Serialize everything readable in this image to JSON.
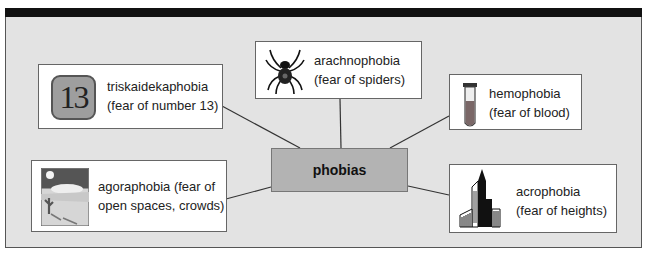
{
  "diagram": {
    "center": {
      "label": "phobias"
    },
    "nodes": [
      {
        "id": "triskaidekaphobia",
        "line1": "triskaidekaphobia",
        "line2": "(fear of number 13)",
        "icon": "number-13-icon",
        "icon_text": "13"
      },
      {
        "id": "arachnophobia",
        "line1": "arachnophobia",
        "line2": "(fear of spiders)",
        "icon": "spider-icon"
      },
      {
        "id": "hemophobia",
        "line1": "hemophobia",
        "line2": "(fear of blood)",
        "icon": "test-tube-blood-icon"
      },
      {
        "id": "agoraphobia",
        "line1": "agoraphobia (fear of",
        "line2": "open spaces, crowds)",
        "icon": "desert-landscape-icon"
      },
      {
        "id": "acrophobia",
        "line1": "acrophobia",
        "line2": "(fear of heights)",
        "icon": "skyscraper-icon"
      }
    ]
  },
  "colors": {
    "frame_bg": "#e3e3e3",
    "top_bar": "#111111",
    "center_bg": "#b3b3b3",
    "node_bg": "#ffffff"
  }
}
